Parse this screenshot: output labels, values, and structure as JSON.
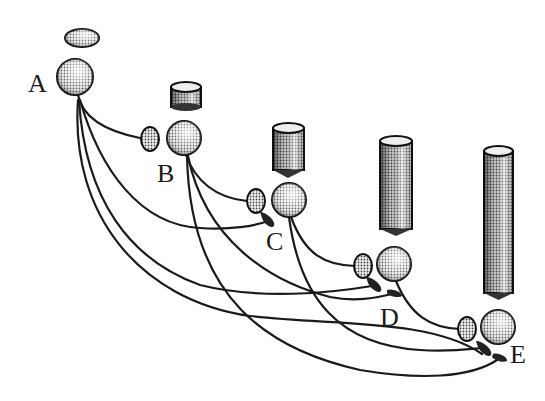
{
  "diagram": {
    "type": "layered network of neuron-like units",
    "colors": {
      "ink": "#1a1a1a",
      "background": "#ffffff",
      "halftone_light": "#e6e6e6",
      "halftone_dark": "#3a3a3a"
    },
    "nodes": [
      {
        "id": "A",
        "label": "A",
        "sphere": {
          "cx": 75,
          "cy": 77,
          "r": 18
        },
        "cap": {
          "type": "disc",
          "cx": 82,
          "cy": 38,
          "rx": 17,
          "ry": 9
        },
        "label_pos": {
          "x": 28,
          "y": 92
        }
      },
      {
        "id": "B",
        "label": "B",
        "sphere": {
          "cx": 184,
          "cy": 138,
          "r": 17
        },
        "ear": {
          "cx": 150,
          "cy": 139
        },
        "cap": {
          "type": "cylinder",
          "x": 171,
          "y": 83,
          "w": 30,
          "h": 24
        },
        "label_pos": {
          "x": 157,
          "y": 182
        }
      },
      {
        "id": "C",
        "label": "C",
        "sphere": {
          "cx": 289,
          "cy": 200,
          "r": 17
        },
        "ear": {
          "cx": 256,
          "cy": 201
        },
        "cap": {
          "type": "cylinder",
          "x": 273,
          "y": 123,
          "w": 31,
          "h": 50
        },
        "label_pos": {
          "x": 266,
          "y": 250
        }
      },
      {
        "id": "D",
        "label": "D",
        "sphere": {
          "cx": 394,
          "cy": 264,
          "r": 17
        },
        "ear": {
          "cx": 363,
          "cy": 266
        },
        "cap": {
          "type": "cylinder",
          "x": 380,
          "y": 136,
          "w": 32,
          "h": 98
        },
        "label_pos": {
          "x": 380,
          "y": 326
        }
      },
      {
        "id": "E",
        "label": "E",
        "sphere": {
          "cx": 498,
          "cy": 327,
          "r": 17
        },
        "ear": {
          "cx": 467,
          "cy": 329
        },
        "cap": {
          "type": "cylinder",
          "x": 484,
          "y": 146,
          "w": 29,
          "h": 152
        },
        "label_pos": {
          "x": 510,
          "y": 363
        }
      }
    ],
    "connections": [
      {
        "from": "A",
        "to": "B",
        "target": "ear"
      },
      {
        "from": "A",
        "to": "C",
        "target": "synapse"
      },
      {
        "from": "A",
        "to": "D",
        "target": "synapse"
      },
      {
        "from": "A",
        "to": "E",
        "target": "synapse"
      },
      {
        "from": "B",
        "to": "C",
        "target": "ear"
      },
      {
        "from": "B",
        "to": "D",
        "target": "synapse"
      },
      {
        "from": "B",
        "to": "E",
        "target": "synapse"
      },
      {
        "from": "C",
        "to": "D",
        "target": "ear"
      },
      {
        "from": "C",
        "to": "E",
        "target": "synapse"
      },
      {
        "from": "D",
        "to": "E",
        "target": "ear"
      }
    ]
  }
}
